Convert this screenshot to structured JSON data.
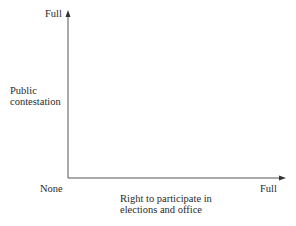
{
  "diagram": {
    "y_axis": {
      "label_line1": "Public",
      "label_line2": "contestation",
      "top_label": "Full"
    },
    "x_axis": {
      "label_line1": "Right to participate in",
      "label_line2": "elections and office",
      "end_label": "Full"
    },
    "origin_label": "None",
    "colors": {
      "axis": "#555555",
      "text": "#2a2a2a"
    }
  }
}
